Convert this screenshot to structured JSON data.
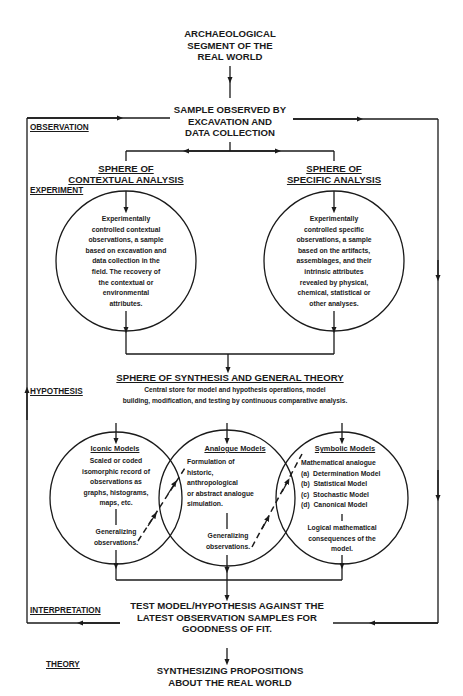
{
  "top_node": {
    "lines": [
      "ARCHAEOLOGICAL",
      "SEGMENT OF THE",
      "REAL WORLD"
    ]
  },
  "sample_node": {
    "lines": [
      "SAMPLE OBSERVED BY",
      "EXCAVATION AND",
      "DATA COLLECTION"
    ]
  },
  "stage_labels": {
    "observation": "OBSERVATION",
    "experiment": "EXPERIMENT",
    "hypothesis": "HYPOTHESIS",
    "interpretation": "INTERPRETATION",
    "theory": "THEORY"
  },
  "contextual_sphere": {
    "title": [
      "SPHERE OF",
      "CONTEXTUAL ANALYSIS"
    ],
    "body": [
      "Experimentally",
      "controlled contextual",
      "observations, a sample",
      "based on excavation and",
      "data collection in the",
      "field. The recovery of",
      "the contextual or",
      "environmental",
      "attributes."
    ]
  },
  "specific_sphere": {
    "title": [
      "SPHERE OF",
      "SPECIFIC ANALYSIS"
    ],
    "body": [
      "Experimentally",
      "controlled specific",
      "observations, a sample",
      "based on the artifacts,",
      "assemblages, and their",
      "intrinsic attributes",
      "revealed by physical,",
      "chemical, statistical or",
      "other analyses."
    ]
  },
  "synthesis": {
    "title": "SPHERE OF SYNTHESIS AND GENERAL THEORY",
    "body": [
      "Central store for model and hypothesis operations, model",
      "building, modification, and testing by continuous comparative analysis."
    ]
  },
  "models": {
    "iconic": {
      "title": "Iconic Models",
      "body": [
        "Scaled or coded",
        "isomorphic record of",
        "observations as",
        "graphs, histograms,",
        "maps, etc."
      ],
      "footer": [
        "Generalizing",
        "observations."
      ]
    },
    "analogue": {
      "title": "Analogue Models",
      "body": [
        "Formulation of",
        "historic,",
        "anthropological",
        "or abstract analogue",
        "simulation."
      ],
      "footer": [
        "Generalizing",
        "observations."
      ]
    },
    "symbolic": {
      "title": "Symbolic Models",
      "intro": "Mathematical analogue",
      "items": [
        "(a)  Determination Model",
        "(b)  Statistical Model",
        "(c)  Stochastic Model",
        "(d)  Canonical Model"
      ],
      "footer": [
        "Logical mathematical",
        "consequences of the",
        "model."
      ]
    }
  },
  "test_node": {
    "lines": [
      "TEST MODEL/HYPOTHESIS AGAINST THE",
      "LATEST OBSERVATION SAMPLES FOR",
      "GOODNESS OF FIT."
    ]
  },
  "final_node": {
    "lines": [
      "SYNTHESIZING PROPOSITIONS",
      "ABOUT THE REAL WORLD"
    ]
  },
  "colors": {
    "ink": "#1a1a1a",
    "background": "#ffffff"
  }
}
